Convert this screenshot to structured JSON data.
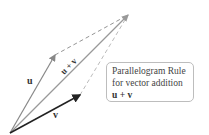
{
  "diagram": {
    "title": "Parallelogram Rule for vector addition",
    "origin": [
      10,
      133
    ],
    "vectors": {
      "u": {
        "label": "u",
        "tip": [
          55,
          55
        ],
        "color": "#888888"
      },
      "v": {
        "label": "v",
        "tip": [
          80,
          95
        ],
        "color": "#222222"
      },
      "sum": {
        "label": "u + v",
        "tip": [
          128,
          15
        ],
        "color": "#999999"
      }
    },
    "dashed_edges": [
      {
        "from": "u",
        "to": "sum"
      },
      {
        "from": "v",
        "to": "sum"
      }
    ]
  },
  "callout": {
    "line1": "Parallelogram Rule",
    "line2": "for vector addition",
    "line3": "u + v"
  }
}
